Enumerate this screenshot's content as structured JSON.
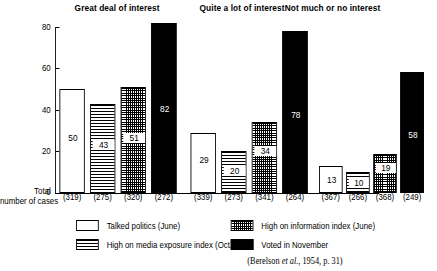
{
  "chart_data": {
    "type": "bar",
    "title": "",
    "xlabel": "",
    "ylabel": "",
    "ylim": [
      0,
      80
    ],
    "yticks": [
      0,
      20,
      40,
      60,
      80
    ],
    "grid": false,
    "legend_position": "bottom",
    "groups": [
      "Great deal of interest",
      "Quite a lot of interest",
      "Not much or no interest"
    ],
    "series": [
      {
        "name": "Talked politics (June)",
        "pattern": "white",
        "values": [
          50,
          29,
          13
        ],
        "cases": [
          319,
          339,
          367
        ]
      },
      {
        "name": "High on media exposure index (Oct.)",
        "pattern": "horizontal-lines",
        "values": [
          43,
          20,
          10
        ],
        "cases": [
          275,
          273,
          266
        ]
      },
      {
        "name": "High on information index (June)",
        "pattern": "crosshatch-grid",
        "values": [
          51,
          34,
          19
        ],
        "cases": [
          320,
          341,
          368
        ]
      },
      {
        "name": "Voted in November",
        "pattern": "solid-black",
        "values": [
          82,
          78,
          58
        ],
        "cases": [
          272,
          264,
          249
        ]
      }
    ],
    "case_label_format": "(n)",
    "annotations": [
      "Total number of cases"
    ],
    "source": "(Berelson et al., 1954, p. 31)"
  },
  "axis": {
    "tick_labels": [
      "80",
      "60",
      "40",
      "20",
      "0"
    ]
  },
  "titles": {
    "group1": "Great deal of interest",
    "group2": "Quite a lot of interest",
    "group3": "Not much or no interest"
  },
  "total_label": {
    "line1": "Total",
    "line2": "number of cases"
  },
  "bars": {
    "g1": {
      "b1": {
        "value": "50",
        "cases": "(319)"
      },
      "b2": {
        "value": "43",
        "cases": "(275)"
      },
      "b3": {
        "value": "51",
        "cases": "(320)"
      },
      "b4": {
        "value": "82",
        "cases": "(272)"
      }
    },
    "g2": {
      "b1": {
        "value": "29",
        "cases": "(339)"
      },
      "b2": {
        "value": "20",
        "cases": "(273)"
      },
      "b3": {
        "value": "34",
        "cases": "(341)"
      },
      "b4": {
        "value": "78",
        "cases": "(264)"
      }
    },
    "g3": {
      "b1": {
        "value": "13",
        "cases": "(367)"
      },
      "b2": {
        "value": "10",
        "cases": "(266)"
      },
      "b3": {
        "value": "19",
        "cases": "(368)"
      },
      "b4": {
        "value": "58",
        "cases": "(249)"
      }
    }
  },
  "legend": {
    "item1": "Talked politics (June)",
    "item2": "High on media exposure index (Oct.)",
    "item3": "High on information index (June)",
    "item4": "Voted in November"
  },
  "credit": {
    "prefix": "(Berelson ",
    "italic": "et al.",
    "suffix": ", 1954, p. 31)"
  }
}
